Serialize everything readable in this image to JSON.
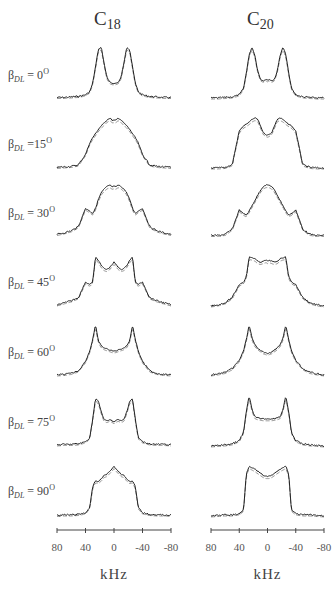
{
  "figure": {
    "columns": [
      {
        "title_main": "C",
        "title_sub": "18",
        "x_left": 57,
        "x_right": 171,
        "title_x": 104
      },
      {
        "title_main": "C",
        "title_sub": "20",
        "x_left": 211,
        "x_right": 324,
        "title_x": 257
      }
    ],
    "rows": [
      {
        "label_beta": "β",
        "label_sub": "DL",
        "label_eq": " = 0",
        "label_deg": "O",
        "baseline_y": 99,
        "label_y": 75
      },
      {
        "label_beta": "β",
        "label_sub": "DL",
        "label_eq": " =15",
        "label_deg": "O",
        "baseline_y": 170,
        "label_y": 144
      },
      {
        "label_beta": "β",
        "label_sub": "DL",
        "label_eq": " = 30",
        "label_deg": "O",
        "baseline_y": 237,
        "label_y": 213
      },
      {
        "label_beta": "β",
        "label_sub": "DL",
        "label_eq": " = 45",
        "label_deg": "O",
        "baseline_y": 308,
        "label_y": 282
      },
      {
        "label_beta": "β",
        "label_sub": "DL",
        "label_eq": " = 60",
        "label_deg": "O",
        "baseline_y": 377,
        "label_y": 352
      },
      {
        "label_beta": "β",
        "label_sub": "DL",
        "label_eq": " = 75",
        "label_deg": "O",
        "baseline_y": 448,
        "label_y": 422
      },
      {
        "label_beta": "β",
        "label_sub": "DL",
        "label_eq": " = 90",
        "label_deg": "O",
        "baseline_y": 518,
        "label_y": 491
      }
    ],
    "x_axis": {
      "ticks": [
        "80",
        "40",
        "0",
        "-40",
        "-80"
      ],
      "title": "kHz",
      "axis_y": 530
    },
    "colors": {
      "experimental": "#222222",
      "simulated": "#888888",
      "axis": "#444444"
    }
  },
  "chart_data": {
    "type": "line",
    "title": "",
    "xlabel": "kHz",
    "ylabel": "",
    "xlim": [
      80,
      -80
    ],
    "x_ticks": [
      80,
      40,
      0,
      -40,
      -80
    ],
    "columns": [
      "C18",
      "C20"
    ],
    "rows": [
      "βDL = 0°",
      "βDL = 15°",
      "βDL = 30°",
      "βDL = 45°",
      "βDL = 60°",
      "βDL = 75°",
      "βDL = 90°"
    ],
    "x": [
      80,
      70,
      60,
      50,
      40,
      34,
      30,
      26,
      22,
      18,
      14,
      10,
      6,
      2,
      0,
      -2,
      -6,
      -10,
      -14,
      -18,
      -22,
      -26,
      -30,
      -34,
      -40,
      -50,
      -60,
      -70,
      -80
    ],
    "series": [
      {
        "name": "C18 βDL=0°",
        "values": [
          0.03,
          0.03,
          0.04,
          0.05,
          0.08,
          0.14,
          0.3,
          0.62,
          0.95,
          1.0,
          0.7,
          0.42,
          0.32,
          0.3,
          0.3,
          0.3,
          0.32,
          0.42,
          0.7,
          1.0,
          0.95,
          0.62,
          0.3,
          0.14,
          0.08,
          0.05,
          0.04,
          0.03,
          0.03
        ]
      },
      {
        "name": "C20 βDL=0°",
        "values": [
          0.02,
          0.02,
          0.03,
          0.04,
          0.08,
          0.2,
          0.5,
          0.85,
          1.0,
          0.85,
          0.55,
          0.38,
          0.35,
          0.38,
          0.36,
          0.38,
          0.35,
          0.38,
          0.55,
          0.85,
          1.0,
          0.85,
          0.5,
          0.2,
          0.08,
          0.04,
          0.03,
          0.02,
          0.02
        ]
      },
      {
        "name": "C18 βDL=15°",
        "values": [
          0.05,
          0.06,
          0.07,
          0.1,
          0.3,
          0.52,
          0.62,
          0.7,
          0.78,
          0.85,
          0.9,
          0.96,
          1.0,
          0.95,
          0.96,
          0.95,
          1.0,
          0.96,
          0.9,
          0.85,
          0.78,
          0.7,
          0.62,
          0.52,
          0.3,
          0.1,
          0.07,
          0.06,
          0.05
        ]
      },
      {
        "name": "C20 βDL=15°",
        "values": [
          0.04,
          0.04,
          0.05,
          0.1,
          0.75,
          0.85,
          0.88,
          0.92,
          0.97,
          1.0,
          0.98,
          0.85,
          0.72,
          0.68,
          0.67,
          0.68,
          0.72,
          0.85,
          0.98,
          1.0,
          0.97,
          0.92,
          0.88,
          0.85,
          0.75,
          0.1,
          0.05,
          0.04,
          0.04
        ]
      },
      {
        "name": "C18 βDL=30°",
        "values": [
          0.05,
          0.08,
          0.12,
          0.2,
          0.55,
          0.5,
          0.45,
          0.55,
          0.72,
          0.85,
          0.92,
          0.97,
          1.0,
          0.96,
          0.98,
          0.96,
          1.0,
          0.97,
          0.92,
          0.85,
          0.72,
          0.55,
          0.45,
          0.5,
          0.55,
          0.2,
          0.12,
          0.08,
          0.05
        ]
      },
      {
        "name": "C20 βDL=30°",
        "values": [
          0.03,
          0.03,
          0.05,
          0.15,
          0.52,
          0.45,
          0.42,
          0.5,
          0.6,
          0.7,
          0.8,
          0.9,
          0.97,
          1.0,
          1.0,
          1.0,
          0.97,
          0.9,
          0.8,
          0.7,
          0.6,
          0.5,
          0.42,
          0.45,
          0.52,
          0.15,
          0.05,
          0.03,
          0.03
        ]
      },
      {
        "name": "C18 βDL=45°",
        "values": [
          0.06,
          0.1,
          0.14,
          0.2,
          0.5,
          0.45,
          0.5,
          0.98,
          0.92,
          0.82,
          0.76,
          0.74,
          0.78,
          0.85,
          0.88,
          0.85,
          0.78,
          0.74,
          0.76,
          0.82,
          0.92,
          0.98,
          0.5,
          0.45,
          0.5,
          0.2,
          0.14,
          0.1,
          0.06
        ]
      },
      {
        "name": "C20 βDL=45°",
        "values": [
          0.04,
          0.06,
          0.1,
          0.2,
          0.45,
          0.5,
          0.6,
          0.98,
          0.97,
          0.95,
          0.9,
          0.88,
          0.9,
          0.92,
          0.9,
          0.92,
          0.9,
          0.88,
          0.9,
          0.95,
          0.97,
          0.98,
          0.6,
          0.5,
          0.45,
          0.2,
          0.1,
          0.06,
          0.04
        ]
      },
      {
        "name": "C18 βDL=60°",
        "values": [
          0.04,
          0.05,
          0.07,
          0.12,
          0.3,
          0.5,
          0.72,
          1.0,
          0.7,
          0.6,
          0.56,
          0.54,
          0.52,
          0.5,
          0.5,
          0.5,
          0.52,
          0.54,
          0.56,
          0.6,
          0.7,
          1.0,
          0.72,
          0.5,
          0.3,
          0.12,
          0.07,
          0.05,
          0.04
        ]
      },
      {
        "name": "C20 βDL=60°",
        "values": [
          0.04,
          0.06,
          0.09,
          0.16,
          0.32,
          0.5,
          0.72,
          1.0,
          0.75,
          0.62,
          0.56,
          0.52,
          0.48,
          0.46,
          0.45,
          0.46,
          0.48,
          0.52,
          0.56,
          0.62,
          0.75,
          1.0,
          0.72,
          0.5,
          0.32,
          0.16,
          0.09,
          0.06,
          0.04
        ]
      },
      {
        "name": "C18 βDL=75°",
        "values": [
          0.06,
          0.07,
          0.07,
          0.08,
          0.12,
          0.2,
          0.55,
          0.95,
          0.9,
          0.7,
          0.55,
          0.52,
          0.55,
          0.52,
          0.5,
          0.52,
          0.55,
          0.52,
          0.55,
          0.7,
          0.9,
          0.95,
          0.55,
          0.2,
          0.12,
          0.08,
          0.07,
          0.07,
          0.06
        ]
      },
      {
        "name": "C20 βDL=75°",
        "values": [
          0.04,
          0.05,
          0.06,
          0.08,
          0.14,
          0.3,
          0.7,
          1.0,
          0.75,
          0.6,
          0.58,
          0.57,
          0.56,
          0.56,
          0.56,
          0.56,
          0.56,
          0.57,
          0.58,
          0.6,
          0.75,
          1.0,
          0.7,
          0.3,
          0.14,
          0.08,
          0.06,
          0.05,
          0.04
        ]
      },
      {
        "name": "C18 βDL=90°",
        "values": [
          0.05,
          0.06,
          0.06,
          0.07,
          0.1,
          0.2,
          0.6,
          0.72,
          0.7,
          0.75,
          0.82,
          0.84,
          0.9,
          0.96,
          1.0,
          0.96,
          0.9,
          0.84,
          0.82,
          0.75,
          0.7,
          0.72,
          0.6,
          0.2,
          0.1,
          0.07,
          0.06,
          0.06,
          0.05
        ]
      },
      {
        "name": "C20 βDL=90°",
        "values": [
          0.04,
          0.05,
          0.06,
          0.06,
          0.08,
          0.15,
          0.85,
          1.0,
          0.97,
          0.94,
          0.9,
          0.86,
          0.82,
          0.8,
          0.8,
          0.8,
          0.82,
          0.86,
          0.9,
          0.94,
          0.97,
          1.0,
          0.85,
          0.15,
          0.08,
          0.06,
          0.06,
          0.05,
          0.04
        ]
      }
    ],
    "legend": null,
    "grid": false
  }
}
